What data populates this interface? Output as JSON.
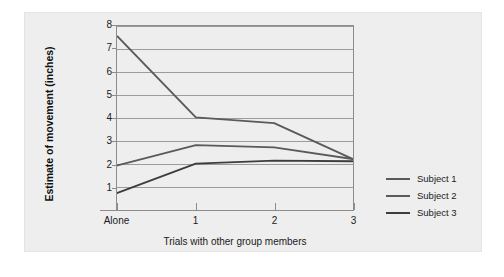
{
  "chart_data": {
    "type": "line",
    "title": "",
    "xlabel": "Trials with other group members",
    "ylabel": "Estimate of movement (inches)",
    "categories": [
      "Alone",
      "1",
      "2",
      "3"
    ],
    "x_tick_labels": [
      "Alone",
      "1",
      "2",
      "3"
    ],
    "y_tick_labels": [
      "1",
      "2",
      "3",
      "4",
      "5",
      "6",
      "7",
      "8"
    ],
    "y_ticks": [
      1,
      2,
      3,
      4,
      5,
      6,
      7,
      8
    ],
    "ylim": [
      0,
      8
    ],
    "xlim": [
      0,
      3
    ],
    "grid": "horizontal",
    "legend_position": "right",
    "series": [
      {
        "name": "Subject 1",
        "color": "#5a5a5a",
        "values": [
          7.55,
          4.05,
          3.8,
          2.25
        ]
      },
      {
        "name": "Subject 2",
        "color": "#5a5a5a",
        "values": [
          1.97,
          2.85,
          2.75,
          2.25
        ]
      },
      {
        "name": "Subject 3",
        "color": "#3d3d3d",
        "values": [
          0.78,
          2.05,
          2.18,
          2.15
        ]
      }
    ]
  },
  "legend": {
    "items": [
      {
        "label": "Subject 1",
        "color": "#5a5a5a"
      },
      {
        "label": "Subject 2",
        "color": "#5a5a5a"
      },
      {
        "label": "Subject 3",
        "color": "#3d3d3d"
      }
    ]
  },
  "colors": {
    "panel_background": "#eeeeee",
    "page_background": "#ffffff",
    "axis": "#8c8c8c",
    "gridline": "#9a9a9a",
    "text": "#1a1a1a"
  }
}
